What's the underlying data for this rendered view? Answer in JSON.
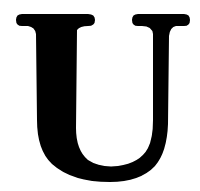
{
  "glyph": {
    "character": "U",
    "style": "serif-bold",
    "fill_color": "#000000",
    "background_color": "#ffffff"
  }
}
